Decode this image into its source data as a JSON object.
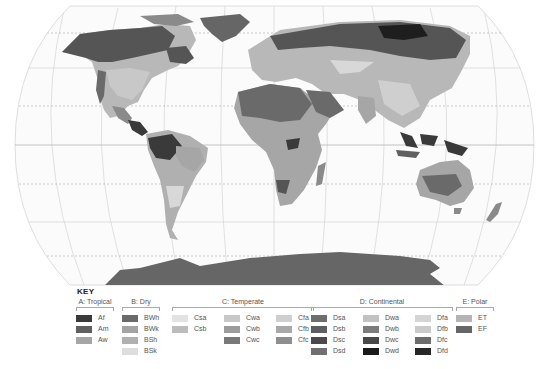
{
  "map": {
    "projection": "Robinson-like world map",
    "graticule": {
      "equator": "solid",
      "tropics": "dashed",
      "polar_circles": "dashed"
    },
    "ocean_color": "#fbfbfb",
    "land_colors": {
      "dark": "#555555",
      "mid": "#8a8a8a",
      "light": "#b8b8b8",
      "pale": "#d8d8d8",
      "darkest": "#1e1e1e"
    }
  },
  "key": {
    "title": "KEY",
    "groups": [
      {
        "label": "A: Tropical",
        "columns": [
          [
            {
              "code": "Af",
              "color": "#3a3a3a"
            },
            {
              "code": "Am",
              "color": "#606060"
            },
            {
              "code": "Aw",
              "color": "#a6a6a6"
            }
          ]
        ]
      },
      {
        "label": "B: Dry",
        "columns": [
          [
            {
              "code": "BWh",
              "color": "#6a6a6a"
            },
            {
              "code": "BWk",
              "color": "#a4a4a4"
            },
            {
              "code": "BSh",
              "color": "#b0b0b0"
            },
            {
              "code": "BSk",
              "color": "#dedede"
            }
          ]
        ]
      },
      {
        "label": "C: Temperate",
        "columns": [
          [
            {
              "code": "Csa",
              "color": "#e2e2e2"
            },
            {
              "code": "Csb",
              "color": "#bcbcbc"
            }
          ],
          [
            {
              "code": "Cwa",
              "color": "#c8c8c8"
            },
            {
              "code": "Cwb",
              "color": "#9c9c9c"
            },
            {
              "code": "Cwc",
              "color": "#787878"
            }
          ],
          [
            {
              "code": "Cfa",
              "color": "#cfcfcf"
            },
            {
              "code": "Cfb",
              "color": "#a8a8a8"
            },
            {
              "code": "Cfc",
              "color": "#8e8e8e"
            }
          ]
        ]
      },
      {
        "label": "D: Continental",
        "columns": [
          [
            {
              "code": "Dsa",
              "color": "#6e6e6e"
            },
            {
              "code": "Dsb",
              "color": "#5e5e5e"
            },
            {
              "code": "Dsc",
              "color": "#4a4a4a"
            },
            {
              "code": "Dsd",
              "color": "#707070"
            }
          ],
          [
            {
              "code": "Dwa",
              "color": "#c2c2c2"
            },
            {
              "code": "Dwb",
              "color": "#7c7c7c"
            },
            {
              "code": "Dwc",
              "color": "#484848"
            },
            {
              "code": "Dwd",
              "color": "#1a1a1a"
            }
          ],
          [
            {
              "code": "Dfa",
              "color": "#d4d4d4"
            },
            {
              "code": "Dfb",
              "color": "#cacaca"
            },
            {
              "code": "Dfc",
              "color": "#6c6c6c"
            },
            {
              "code": "Dfd",
              "color": "#262626"
            }
          ]
        ]
      },
      {
        "label": "E: Polar",
        "columns": [
          [
            {
              "code": "ET",
              "color": "#b4b4b4"
            },
            {
              "code": "EF",
              "color": "#666666"
            }
          ]
        ]
      }
    ]
  }
}
